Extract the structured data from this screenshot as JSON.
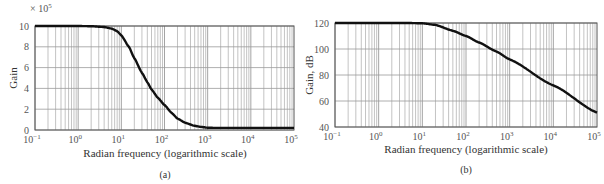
{
  "chart_data": [
    {
      "type": "line",
      "panel_label": "(a)",
      "title": "",
      "xlabel": "Radian frequency (logarithmic scale)",
      "ylabel": "Gain",
      "y_multiplier": "× 10⁵",
      "xscale": "log",
      "xlim": [
        0.1,
        100000
      ],
      "ylim": [
        0,
        10
      ],
      "grid": true,
      "x_ticks": [
        "10⁻¹",
        "10⁰",
        "10¹",
        "10²",
        "10³",
        "10⁴",
        "10⁵"
      ],
      "x_tick_exponents": [
        -1,
        0,
        1,
        2,
        3,
        4,
        5
      ],
      "y_ticks": [
        0,
        2,
        4,
        6,
        8,
        10
      ],
      "series": [
        {
          "name": "Gain",
          "x": [
            0.1,
            1,
            2,
            4,
            6,
            8,
            10,
            15,
            20,
            30,
            40,
            50,
            70,
            100,
            150,
            200,
            300,
            500,
            700,
            1000,
            1500,
            2000,
            5000,
            10000,
            100000
          ],
          "values": [
            10,
            10,
            9.98,
            9.9,
            9.75,
            9.5,
            9.1,
            8.0,
            6.9,
            5.5,
            4.6,
            3.9,
            3.1,
            2.4,
            1.6,
            1.1,
            0.7,
            0.4,
            0.3,
            0.22,
            0.2,
            0.2,
            0.2,
            0.2,
            0.2
          ]
        }
      ]
    },
    {
      "type": "line",
      "panel_label": "(b)",
      "title": "",
      "xlabel": "Radian frequency (logarithmic scale)",
      "ylabel": "Gain, dB",
      "xscale": "log",
      "xlim": [
        0.1,
        100000
      ],
      "ylim": [
        40,
        120
      ],
      "grid": true,
      "x_ticks": [
        "10⁻¹",
        "10⁰",
        "10¹",
        "10²",
        "10³",
        "10⁴",
        "10⁵"
      ],
      "x_tick_exponents": [
        -1,
        0,
        1,
        2,
        3,
        4,
        5
      ],
      "y_ticks": [
        40,
        60,
        80,
        100,
        120
      ],
      "series": [
        {
          "name": "Gain (dB)",
          "x": [
            0.1,
            1,
            5,
            10,
            20,
            50,
            100,
            200,
            500,
            1000,
            10000,
            100000
          ],
          "values": [
            120,
            120,
            120,
            119.8,
            118.5,
            114,
            110,
            105,
            98,
            92,
            72,
            51
          ]
        }
      ]
    }
  ],
  "panels": {
    "a": {
      "caption": "(a)",
      "xlabel": "Radian frequency (logarithmic scale)",
      "ylabel": "Gain",
      "multiplier": "× 10",
      "multiplier_exp": "5"
    },
    "b": {
      "caption": "(b)",
      "xlabel": "Radian frequency (logarithmic scale)",
      "ylabel": "Gain, dB"
    }
  },
  "colors": {
    "curve": "#111111",
    "grid": "#9a9a9a",
    "frame": "#555555",
    "text": "#444444"
  }
}
